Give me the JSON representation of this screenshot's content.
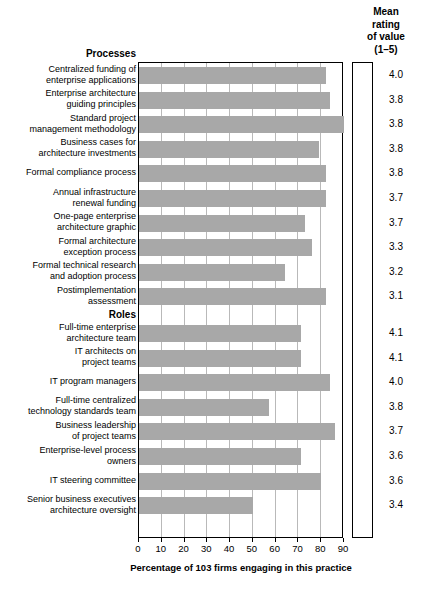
{
  "header": {
    "mean_col_lines": [
      "Mean",
      "rating",
      "of value",
      "(1–5)"
    ]
  },
  "axis": {
    "xlabel": "Percentage of 103 firms engaging in this practice",
    "ticks": [
      "0",
      "10",
      "20",
      "30",
      "40",
      "50",
      "60",
      "70",
      "80",
      "90"
    ]
  },
  "sections": [
    {
      "title": "Processes"
    },
    {
      "title": "Roles"
    }
  ],
  "chart_data": {
    "type": "bar",
    "orientation": "horizontal",
    "title": "",
    "xlabel": "Percentage of 103 firms engaging in this practice",
    "ylabel": "",
    "xlim": [
      0,
      90
    ],
    "xticks": [
      0,
      10,
      20,
      30,
      40,
      50,
      60,
      70,
      80,
      90
    ],
    "grid": true,
    "legend": null,
    "bar_color": "#a8a8a8",
    "extra_column": {
      "header": "Mean rating of value (1–5)",
      "values": [
        4.0,
        3.8,
        3.8,
        3.8,
        3.8,
        3.7,
        3.7,
        3.3,
        3.2,
        3.1,
        4.1,
        4.1,
        4.0,
        3.8,
        3.7,
        3.6,
        3.6,
        3.4
      ]
    },
    "groups": [
      {
        "name": "Processes",
        "categories": [
          "Centralized funding of enterprise applications",
          "Enterprise architecture guiding principles",
          "Standard project management methodology",
          "Business cases for architecture investments",
          "Formal compliance process",
          "Annual infrastructure renewal funding",
          "One-page enterprise architecture graphic",
          "Formal architecture exception process",
          "Formal technical research and adoption process",
          "Postimplementation assessment"
        ],
        "values": [
          82,
          84,
          90,
          79,
          82,
          82,
          73,
          76,
          64,
          82
        ],
        "mean_ratings": [
          4.0,
          3.8,
          3.8,
          3.8,
          3.8,
          3.7,
          3.7,
          3.3,
          3.2,
          3.1
        ]
      },
      {
        "name": "Roles",
        "categories": [
          "Full-time enterprise architecture team",
          "IT architects on project teams",
          "IT program managers",
          "Full-time centralized technology standards team",
          "Business leadership of project teams",
          "Enterprise-level process owners",
          "IT steering committee",
          "Senior business executives architecture oversight"
        ],
        "values": [
          71,
          71,
          84,
          57,
          86,
          71,
          80,
          50
        ],
        "mean_ratings": [
          4.1,
          4.1,
          4.0,
          3.8,
          3.7,
          3.6,
          3.6,
          3.4
        ]
      }
    ]
  },
  "rows": [
    {
      "label_lines": [
        "Centralized funding of",
        "enterprise applications"
      ],
      "value": 82,
      "mean": "4.0"
    },
    {
      "label_lines": [
        "Enterprise architecture",
        "guiding principles"
      ],
      "value": 84,
      "mean": "3.8"
    },
    {
      "label_lines": [
        "Standard project",
        "management methodology"
      ],
      "value": 90,
      "mean": "3.8"
    },
    {
      "label_lines": [
        "Business cases for",
        "architecture investments"
      ],
      "value": 79,
      "mean": "3.8"
    },
    {
      "label_lines": [
        "Formal compliance process"
      ],
      "value": 82,
      "mean": "3.8"
    },
    {
      "label_lines": [
        "Annual infrastructure",
        "renewal funding"
      ],
      "value": 82,
      "mean": "3.7"
    },
    {
      "label_lines": [
        "One-page enterprise",
        "architecture graphic"
      ],
      "value": 73,
      "mean": "3.7"
    },
    {
      "label_lines": [
        "Formal architecture",
        "exception process"
      ],
      "value": 76,
      "mean": "3.3"
    },
    {
      "label_lines": [
        "Formal technical research",
        "and adoption process"
      ],
      "value": 64,
      "mean": "3.2"
    },
    {
      "label_lines": [
        "Postimplementation",
        "assessment"
      ],
      "value": 82,
      "mean": "3.1"
    },
    {
      "label_lines": [
        "Full-time enterprise",
        "architecture team"
      ],
      "value": 71,
      "mean": "4.1"
    },
    {
      "label_lines": [
        "IT architects on",
        "project teams"
      ],
      "value": 71,
      "mean": "4.1"
    },
    {
      "label_lines": [
        "IT program managers"
      ],
      "value": 84,
      "mean": "4.0"
    },
    {
      "label_lines": [
        "Full-time centralized",
        "technology standards team"
      ],
      "value": 57,
      "mean": "3.8"
    },
    {
      "label_lines": [
        "Business leadership",
        "of project teams"
      ],
      "value": 86,
      "mean": "3.7"
    },
    {
      "label_lines": [
        "Enterprise-level process",
        "owners"
      ],
      "value": 71,
      "mean": "3.6"
    },
    {
      "label_lines": [
        "IT steering committee"
      ],
      "value": 80,
      "mean": "3.6"
    },
    {
      "label_lines": [
        "Senior business executives",
        "architecture oversight"
      ],
      "value": 50,
      "mean": "3.4"
    }
  ]
}
